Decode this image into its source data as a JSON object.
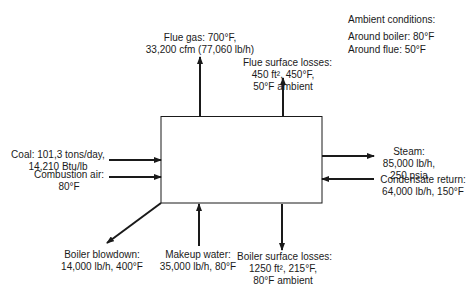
{
  "diagram": {
    "node": {
      "name": "boiler",
      "label": ""
    },
    "ambient": {
      "title": "Ambient conditions:",
      "lines": [
        "Around boiler: 80°F",
        "Around flue: 50°F"
      ]
    },
    "streams": {
      "flue_gas": {
        "direction": "out",
        "lines": [
          "Flue gas: 700°F,",
          "33,200 cfm (77,060 lb/h)"
        ]
      },
      "flue_surface_losses": {
        "direction": "out",
        "lines": [
          "Flue surface losses:",
          "450 ft², 450°F,",
          "50°F ambient"
        ]
      },
      "coal": {
        "direction": "in",
        "lines": [
          "Coal: 101,3 tons/day,",
          "14,210 Btu/lb"
        ]
      },
      "combustion_air": {
        "direction": "in",
        "lines": [
          "Combustion air:",
          "80°F"
        ]
      },
      "steam": {
        "direction": "out",
        "lines": [
          "Steam:",
          "85,000 lb/h,",
          "250 psia"
        ]
      },
      "condensate_return": {
        "direction": "in",
        "lines": [
          "Condensate return:",
          "64,000 lb/h, 150°F"
        ]
      },
      "boiler_blowdown": {
        "direction": "out",
        "lines": [
          "Boiler blowdown:",
          "14,000 lb/h, 400°F"
        ]
      },
      "makeup_water": {
        "direction": "in",
        "lines": [
          "Makeup water:",
          "35,000 lb/h, 80°F"
        ]
      },
      "boiler_surface_losses": {
        "direction": "out",
        "lines": [
          "Boiler surface losses:",
          "1250 ft², 215°F,",
          "80°F ambient"
        ]
      }
    },
    "colors": {
      "stroke": "#1a1a1a",
      "background": "#ffffff"
    }
  }
}
